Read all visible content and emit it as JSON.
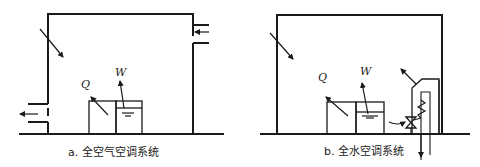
{
  "diagrams": [
    {
      "id": "a",
      "caption": "a. 全空气空调系统",
      "labels": {
        "heat": "Q",
        "moisture": "W"
      },
      "description": "Room with supply air duct (right, inflow arrow), return/exhaust air duct (left, outflow arrow), window heat gain arrow, heat source Q and moisture source W"
    },
    {
      "id": "b",
      "caption": "b. 全水空调系统",
      "labels": {
        "heat": "Q",
        "moisture": "W"
      },
      "description": "Room with fan-coil unit on right side: coil, valve, water supply and return pipes through floor; heat source Q and moisture source W"
    }
  ],
  "colors": {
    "line": "#1a1a1a",
    "background": "#ffffff"
  }
}
